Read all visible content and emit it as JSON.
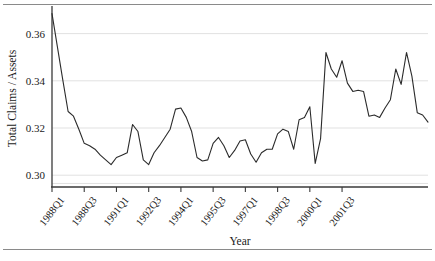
{
  "chart_data": {
    "type": "line",
    "title": "",
    "xlabel": "Year",
    "ylabel": "Total Claims / Assets",
    "ylim": [
      0.295,
      0.37
    ],
    "yticks": [
      0.3,
      0.32,
      0.34,
      0.36
    ],
    "ytick_labels": [
      "0.30",
      "0.32",
      "0.34",
      "0.36"
    ],
    "grid": true,
    "legend": "none",
    "xtick_labels": [
      "1988Q1",
      "1988Q3",
      "1991Q1",
      "1992Q3",
      "1994Q1",
      "1995Q3",
      "1997Q1",
      "1998Q3",
      "2000Q1",
      "2001Q3"
    ],
    "xtick_indices": [
      0,
      6,
      12,
      18,
      24,
      30,
      36,
      42,
      48,
      54
    ],
    "x_count": 58,
    "series": [
      {
        "name": "Total Claims / Assets",
        "values": [
          0.3685,
          0.3545,
          0.3405,
          0.327,
          0.325,
          0.3195,
          0.3135,
          0.3125,
          0.311,
          0.3085,
          0.3065,
          0.3045,
          0.3075,
          0.3085,
          0.3095,
          0.3215,
          0.3185,
          0.3065,
          0.3045,
          0.3095,
          0.3125,
          0.316,
          0.3195,
          0.328,
          0.3285,
          0.3245,
          0.3185,
          0.3075,
          0.306,
          0.3065,
          0.3135,
          0.316,
          0.3125,
          0.3075,
          0.3105,
          0.3145,
          0.315,
          0.309,
          0.3055,
          0.3095,
          0.311,
          0.311,
          0.3175,
          0.3195,
          0.3185,
          0.311,
          0.3235,
          0.3245,
          0.329,
          0.305,
          0.3155,
          0.352,
          0.345,
          0.3415,
          0.3485,
          0.339,
          0.3355,
          0.336
        ]
      }
    ],
    "extended_values": [
      0.336,
      0.3355,
      0.325,
      0.3255,
      0.3245,
      0.3285,
      0.332,
      0.345,
      0.3385,
      0.352,
      0.342,
      0.3265,
      0.3255,
      0.3225
    ]
  },
  "axis": {
    "ylabel": "Total Claims / Assets",
    "xlabel": "Year"
  },
  "colors": {
    "line": "#2b2b2b",
    "grid": "#d9d9d9",
    "axis": "#3a3a3a",
    "rule": "#8a8a8a",
    "background": "#ffffff"
  }
}
